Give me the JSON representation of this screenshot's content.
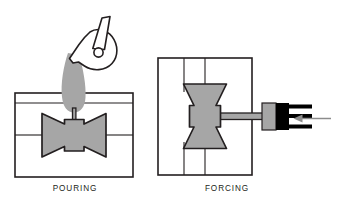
{
  "figure": {
    "type": "technical-process-diagram",
    "background_color": "#ffffff",
    "line_color": "#231f20",
    "fill_gray": "#a6a6a6",
    "fill_black": "#000000",
    "arrow_color": "#8c8c8c"
  },
  "panels": [
    {
      "id": "pouring",
      "label": "POURING",
      "label_x": 0,
      "label_y": 184,
      "label_width": 150,
      "mold": {
        "x": 15,
        "y": 93,
        "width": 118,
        "height": 84,
        "parting_line_y": 135
      },
      "casting": {
        "orientation": "horizontal",
        "shape": "bowtie",
        "center_x": 74,
        "center_y": 135,
        "half_width": 32,
        "half_height": 22,
        "waist_half_width": 9,
        "waist_half_height": 11
      },
      "sprue": {
        "x": 74,
        "y_top": 110,
        "y_bottom": 124,
        "width": 3
      },
      "pour_stream": {
        "top_x": 72,
        "top_y": 52,
        "bottom_x": 74,
        "bottom_y": 112,
        "top_half_width": 9,
        "bottom_half_width": 14
      },
      "ladle": {
        "pivot_x": 97,
        "pivot_y": 52,
        "pivot_r": 4.5,
        "handle_angle_deg": -72,
        "handle_length": 36
      }
    },
    {
      "id": "forcing",
      "label": "FORCING",
      "label_x": 152,
      "label_y": 184,
      "label_width": 150,
      "mold": {
        "x": 158,
        "y": 58,
        "width": 94,
        "height": 117,
        "parting_line_x": 205
      },
      "casting": {
        "orientation": "vertical",
        "shape": "bowtie",
        "center_x": 205,
        "center_y": 116,
        "half_width": 22,
        "half_height": 32,
        "waist_half_width": 11,
        "waist_half_height": 9
      },
      "runner": {
        "x_left": 216,
        "x_right": 262,
        "y": 116,
        "height": 6
      },
      "plunger_gray": {
        "x": 262,
        "y": 103,
        "width": 13,
        "height": 27
      },
      "ram_black": {
        "x": 275,
        "y": 103,
        "width": 14,
        "height": 27
      },
      "ram_prongs": [
        {
          "x": 289,
          "y": 105,
          "width": 23,
          "height": 4
        },
        {
          "x": 289,
          "y": 114,
          "width": 23,
          "height": 4
        },
        {
          "x": 289,
          "y": 124,
          "width": 23,
          "height": 4
        }
      ],
      "force_arrow": {
        "from_x": 331,
        "to_x": 294,
        "y": 118,
        "direction": "left"
      }
    }
  ]
}
